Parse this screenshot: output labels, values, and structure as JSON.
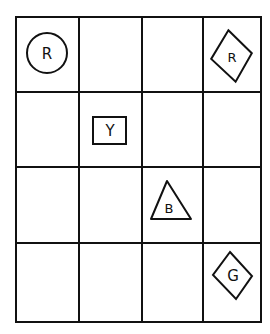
{
  "grid": {
    "rows": 4,
    "cols": 4,
    "col_edges": [
      16,
      79,
      142,
      203,
      261
    ],
    "row_edges": [
      17,
      92,
      167,
      243,
      322
    ],
    "line_color": "#111111"
  },
  "pieces": [
    {
      "row": 0,
      "col": 0,
      "shape": "circle",
      "label": "R"
    },
    {
      "row": 0,
      "col": 3,
      "shape": "diamond",
      "label": "R"
    },
    {
      "row": 1,
      "col": 1,
      "shape": "square",
      "label": "Y"
    },
    {
      "row": 2,
      "col": 2,
      "shape": "triangle",
      "label": "B"
    },
    {
      "row": 3,
      "col": 3,
      "shape": "diamond",
      "label": "G"
    }
  ]
}
